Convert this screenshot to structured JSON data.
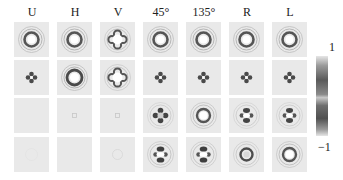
{
  "figure": {
    "column_labels": [
      "U",
      "H",
      "V",
      "45°",
      "135°",
      "R",
      "L"
    ],
    "row_count": 4,
    "colorbar": {
      "max_label": "1",
      "min_label": "−1",
      "colormap": "gray"
    },
    "panels": [
      [
        "ring",
        "ring",
        "clover-ring",
        "ring",
        "ring",
        "ring",
        "ring"
      ],
      [
        "clover-small",
        "ring-large",
        "clover-ring",
        "clover-small",
        "clover-small",
        "clover-small",
        "clover-small"
      ],
      [
        "blank",
        "faint-dot",
        "faint-dot",
        "clover-dark",
        "ring-bright",
        "clover-h",
        "clover-h"
      ],
      [
        "blank-faint",
        "blank",
        "faint-ring",
        "clover-v",
        "clover-v",
        "ring-dark",
        "ring-bright"
      ]
    ]
  }
}
